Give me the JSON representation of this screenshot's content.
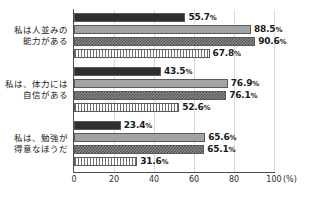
{
  "chart_data": {
    "type": "bar",
    "orientation": "horizontal",
    "title": "",
    "xlabel": "(%)",
    "ylabel": "",
    "xlim": [
      0,
      100
    ],
    "xticks": [
      0,
      20,
      40,
      60,
      80,
      100
    ],
    "xtick_labels": [
      "0",
      "20",
      "40",
      "60",
      "80",
      "100"
    ],
    "grid": true,
    "grid_axis": "x",
    "legend": "none",
    "value_suffix": "%",
    "categories": [
      "私は人並みの\n能力がある",
      "私は、体力には\n自信がある",
      "私は、勉強が\n得意なほうだ"
    ],
    "series": [
      {
        "name": "series-1",
        "pattern": "solid-dark",
        "color": "#2f2f2f",
        "values": [
          55.7,
          43.5,
          23.4
        ]
      },
      {
        "name": "series-2",
        "pattern": "solid-light",
        "color": "#a3a3a3",
        "values": [
          88.5,
          76.9,
          65.6
        ]
      },
      {
        "name": "series-3",
        "pattern": "checker-gray",
        "color": "#8a8a8a",
        "values": [
          90.6,
          76.1,
          65.1
        ]
      },
      {
        "name": "series-4",
        "pattern": "vertical-lines",
        "color": "#6e6e6e",
        "values": [
          67.8,
          52.6,
          31.6
        ]
      }
    ],
    "value_labels": [
      [
        "55.7",
        "88.5",
        "90.6",
        "67.8"
      ],
      [
        "43.5",
        "76.9",
        "76.1",
        "52.6"
      ],
      [
        "23.4",
        "65.6",
        "65.1",
        "31.6"
      ]
    ]
  },
  "axis": {
    "unit_label": "(%)",
    "ticks": [
      "0",
      "20",
      "40",
      "60",
      "80",
      "100"
    ]
  }
}
